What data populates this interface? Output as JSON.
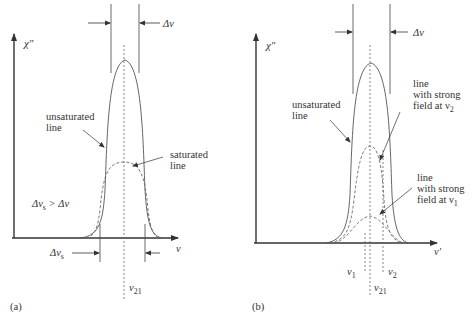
{
  "panels": [
    {
      "id": "a",
      "caption": "(a)",
      "y_axis_label": "χ″",
      "x_axis_label": "ν",
      "top_width_label": "Δν",
      "bottom_width_label": "Δν",
      "bottom_width_sub": "s",
      "condition_label": "Δν",
      "condition_sub": "s",
      "condition_rest": " > Δν",
      "center_label": "ν",
      "center_sub": "21",
      "annotations": {
        "unsaturated_1": "unsaturated",
        "unsaturated_2": "line",
        "saturated_1": "saturated",
        "saturated_2": "line"
      }
    },
    {
      "id": "b",
      "caption": "(b)",
      "y_axis_label": "χ″",
      "x_axis_label": "ν′",
      "top_width_label": "Δν",
      "center_label": "ν",
      "center_sub": "21",
      "nu1_label": "ν",
      "nu1_sub": "1",
      "nu2_label": "ν",
      "nu2_sub": "2",
      "annotations": {
        "unsaturated_1": "unsaturated",
        "unsaturated_2": "line",
        "strong_v2_1": "line",
        "strong_v2_2": "with strong",
        "strong_v2_3": "field at ν",
        "strong_v2_sub": "2",
        "strong_v1_1": "line",
        "strong_v1_2": "with strong",
        "strong_v1_3": "field at ν",
        "strong_v1_sub": "1"
      }
    }
  ],
  "colors": {
    "axis": "#333333",
    "curve": "#555555",
    "dashed": "#666666"
  }
}
